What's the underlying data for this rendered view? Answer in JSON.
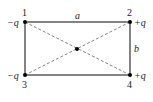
{
  "diagram": {
    "side_labels": {
      "top": "a",
      "right": "b"
    },
    "corners": [
      {
        "index": "1",
        "charge": "−q",
        "position": "top-left"
      },
      {
        "index": "2",
        "charge": "+q",
        "position": "top-right"
      },
      {
        "index": "3",
        "charge": "−q",
        "position": "bottom-left"
      },
      {
        "index": "4",
        "charge": "+q",
        "position": "bottom-right"
      }
    ],
    "center_point": "center",
    "colors": {
      "edge": "#333333",
      "diagonal": "#777777",
      "dot": "#000000"
    }
  }
}
